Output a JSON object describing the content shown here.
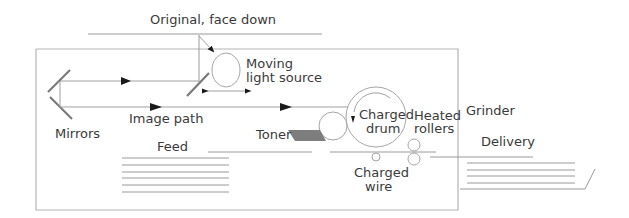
{
  "diagram": {
    "type": "photocopier schematic",
    "labels": {
      "original": "Original, face down",
      "light_source_line1": "Moving",
      "light_source_line2": "light source",
      "mirrors": "Mirrors",
      "image_path": "Image path",
      "toner": "Toner",
      "drum_line1": "Charged",
      "drum_line2": "drum",
      "rollers_line1": "Heated",
      "rollers_line2": "rollers",
      "wire_line1": "Charged",
      "wire_line2": "wire",
      "feed": "Feed",
      "grinder": "Grinder",
      "delivery": "Delivery"
    },
    "colors": {
      "line": "#9a9a9a",
      "frame": "#b5b5b5",
      "mirror": "#7a7a7a",
      "toner_fill": "#7d7d7d",
      "arrow": "#1a1a1a",
      "text": "#3a3a3a"
    }
  }
}
